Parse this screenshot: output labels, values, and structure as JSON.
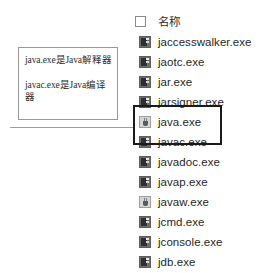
{
  "annotation": {
    "line1": "java.exe是Java解释器",
    "line2": "javac.exe是Java编译器"
  },
  "file_list": {
    "header": {
      "checkbox_checked": false,
      "column_title": "名称"
    },
    "rows": [
      {
        "name": "jaccesswalker.exe",
        "icon": "console-exe-icon",
        "highlighted": false
      },
      {
        "name": "jaotc.exe",
        "icon": "console-exe-icon",
        "highlighted": false
      },
      {
        "name": "jar.exe",
        "icon": "console-exe-icon",
        "highlighted": false
      },
      {
        "name": "jarsigner.exe",
        "icon": "console-exe-icon",
        "highlighted": false
      },
      {
        "name": "java.exe",
        "icon": "java-app-icon",
        "highlighted": true
      },
      {
        "name": "javac.exe",
        "icon": "console-exe-icon",
        "highlighted": true
      },
      {
        "name": "javadoc.exe",
        "icon": "console-exe-icon",
        "highlighted": false
      },
      {
        "name": "javap.exe",
        "icon": "console-exe-icon",
        "highlighted": false
      },
      {
        "name": "javaw.exe",
        "icon": "java-app-icon",
        "highlighted": false
      },
      {
        "name": "jcmd.exe",
        "icon": "console-exe-icon",
        "highlighted": false
      },
      {
        "name": "jconsole.exe",
        "icon": "console-exe-icon",
        "highlighted": false
      },
      {
        "name": "jdb.exe",
        "icon": "console-exe-icon",
        "highlighted": false
      }
    ]
  },
  "colors": {
    "highlight_border": "#1a1a1a",
    "callout_border": "#9a9a9a",
    "leader_line": "#9d9d9d",
    "text": "#1f1f1f",
    "background": "#ffffff"
  }
}
